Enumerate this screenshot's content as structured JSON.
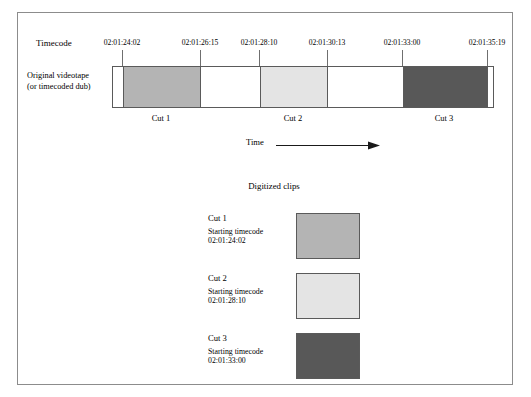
{
  "figure": {
    "timecode_label": "Timecode",
    "tape_caption_line1": "Original videotape",
    "tape_caption_line2": "(or timecoded dub)",
    "time_axis_label": "Time",
    "digitized_heading": "Digitized clips",
    "starting_timecode_label": "Starting timecode"
  },
  "timecodes": [
    {
      "value": "02:01:24:02",
      "x": 122
    },
    {
      "value": "02:01:26:15",
      "x": 200
    },
    {
      "value": "02:01:28:10",
      "x": 259
    },
    {
      "value": "02:01:30:13",
      "x": 327
    },
    {
      "value": "02:01:33:00",
      "x": 402
    },
    {
      "value": "02:01:35:19",
      "x": 487
    }
  ],
  "tape_segments": [
    {
      "name": "Cut 1",
      "color": "#b4b4b4",
      "start": 122,
      "end": 200
    },
    {
      "name": "gap-1",
      "color": "#ffffff",
      "start": 200,
      "end": 259
    },
    {
      "name": "Cut 2",
      "color": "#e4e4e4",
      "start": 259,
      "end": 327
    },
    {
      "name": "gap-2",
      "color": "#ffffff",
      "start": 327,
      "end": 402
    },
    {
      "name": "Cut 3",
      "color": "#585858",
      "start": 402,
      "end": 487
    }
  ],
  "cut_labels": [
    {
      "label": "Cut 1",
      "x": 161
    },
    {
      "label": "Cut 2",
      "x": 293
    },
    {
      "label": "Cut 3",
      "x": 444
    }
  ],
  "clips": [
    {
      "title": "Cut 1",
      "sub_label": "Starting timecode",
      "timecode": "02:01:24:02",
      "color": "#b4b4b4",
      "top": 213
    },
    {
      "title": "Cut 2",
      "sub_label": "Starting timecode",
      "timecode": "02:01:28:10",
      "color": "#e4e4e4",
      "top": 273
    },
    {
      "title": "Cut 3",
      "sub_label": "Starting timecode",
      "timecode": "02:01:33:00",
      "color": "#585858",
      "top": 333
    }
  ],
  "colors": {
    "frame_border": "#8c8c8c",
    "stroke": "#5a5a5a",
    "tick": "#6f6f6f",
    "background": "#ffffff",
    "text": "#000000"
  }
}
